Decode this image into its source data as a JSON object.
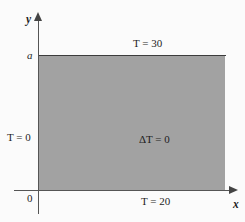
{
  "figure": {
    "type": "boundary-value-diagram",
    "colors": {
      "plate_fill": "#a2a2a2",
      "background": "#fbfbfb",
      "axis": "#555555",
      "edge": "#3c3c3c",
      "text": "#1d1d1d"
    },
    "axes": {
      "x_label": "x",
      "y_label": "y",
      "origin_label": "0",
      "y_tick_label": "a"
    },
    "labels": {
      "top_boundary": "T = 30",
      "left_boundary": "T = 0",
      "bottom_boundary": "T = 20",
      "interior": "ΔT = 0"
    }
  }
}
